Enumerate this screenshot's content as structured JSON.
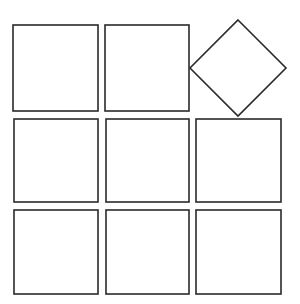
{
  "diagram": {
    "stroke_color": "#2a2a2a",
    "fill_color": "#ffffff",
    "background": "#ffffff",
    "stroke_width": 1.6,
    "shapes": [
      {
        "id": "r1c1",
        "type": "square",
        "row": 1,
        "col": 1,
        "x": 13,
        "y": 25,
        "w": 85,
        "h": 86,
        "rotation": 0
      },
      {
        "id": "r1c2",
        "type": "square",
        "row": 1,
        "col": 2,
        "x": 105,
        "y": 25,
        "w": 84,
        "h": 86,
        "rotation": 0
      },
      {
        "id": "r1c3",
        "type": "diamond",
        "row": 1,
        "col": 3,
        "cx": 238,
        "cy": 68,
        "half_diag": 48,
        "rotation": 45
      },
      {
        "id": "r2c1",
        "type": "square",
        "row": 2,
        "col": 1,
        "x": 14,
        "y": 119,
        "w": 84,
        "h": 83,
        "rotation": 0
      },
      {
        "id": "r2c2",
        "type": "square",
        "row": 2,
        "col": 2,
        "x": 106,
        "y": 119,
        "w": 83,
        "h": 83,
        "rotation": 0
      },
      {
        "id": "r2c3",
        "type": "square",
        "row": 2,
        "col": 3,
        "x": 196,
        "y": 119,
        "w": 85,
        "h": 83,
        "rotation": 0
      },
      {
        "id": "r3c1",
        "type": "square",
        "row": 3,
        "col": 1,
        "x": 14,
        "y": 210,
        "w": 84,
        "h": 84,
        "rotation": 0
      },
      {
        "id": "r3c2",
        "type": "square",
        "row": 3,
        "col": 2,
        "x": 106,
        "y": 210,
        "w": 83,
        "h": 84,
        "rotation": 0
      },
      {
        "id": "r3c3",
        "type": "square",
        "row": 3,
        "col": 3,
        "x": 196,
        "y": 210,
        "w": 85,
        "h": 84,
        "rotation": 0
      }
    ]
  }
}
